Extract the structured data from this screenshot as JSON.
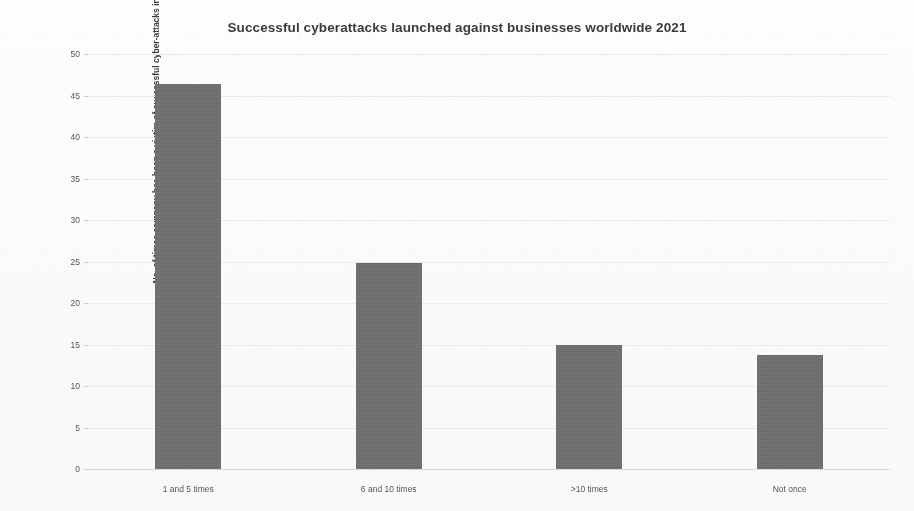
{
  "chart_data": {
    "type": "bar",
    "title": "Successful cyberattacks launched against businesses worldwide 2021",
    "xlabel": "",
    "ylabel": "No. of times company has been a victim of successful cyber-attacks in last 12 months",
    "categories": [
      "1 and 5 times",
      "6 and 10 times",
      ">10 times",
      "Not once"
    ],
    "values": [
      46.4,
      24.8,
      14.9,
      13.7
    ],
    "ylim": [
      0,
      50
    ],
    "yticks": [
      0,
      5,
      10,
      15,
      20,
      25,
      30,
      35,
      40,
      45,
      50
    ],
    "ytick_labels": [
      "0",
      "5",
      "10",
      "15",
      "20",
      "25",
      "30",
      "35",
      "40",
      "45",
      "50"
    ],
    "grid": true,
    "legend": false,
    "legend_position": "none",
    "series": [
      {
        "name": "No. of times company has been a victim of successful cyber-attacks in last 12 months",
        "values": [
          46.4,
          24.8,
          14.9,
          13.7
        ],
        "color": "#6e6e6e"
      }
    ],
    "colors": {
      "bar": "#6e6e6e",
      "gridline": "#e9e9e9",
      "axis": "#d8d8d8",
      "title_text": "#3b3b3b",
      "tick_text": "#555555",
      "background": "#fdfdfd"
    }
  }
}
